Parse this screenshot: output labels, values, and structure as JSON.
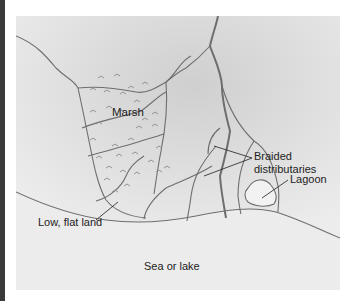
{
  "diagram": {
    "type": "delta landform illustration",
    "labels": {
      "marsh": "Marsh",
      "braided_line1": "Braided",
      "braided_line2": "distributaries",
      "lagoon": "Lagoon",
      "low_flat_land": "Low, flat land",
      "sea_or_lake": "Sea or lake"
    },
    "colors": {
      "line": "#6e6e6e",
      "leader": "#333333",
      "lagoon_fill": "#f2f2f2",
      "sea_fill": "#ededed",
      "edge_bar": "#3a3a3a"
    }
  }
}
